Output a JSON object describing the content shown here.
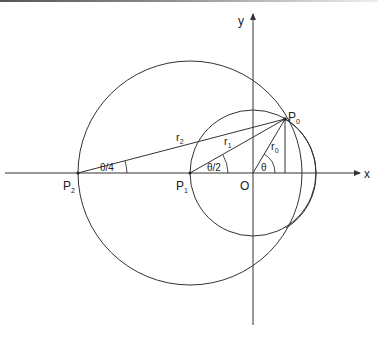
{
  "diagram": {
    "axes": {
      "x_label": "x",
      "y_label": "y",
      "origin_label": "O"
    },
    "points": {
      "P0": {
        "label": "P",
        "sub": "0"
      },
      "P1": {
        "label": "P",
        "sub": "1"
      },
      "P2": {
        "label": "P",
        "sub": "2"
      }
    },
    "radii": {
      "r0": {
        "label": "r",
        "sub": "0"
      },
      "r1": {
        "label": "r",
        "sub": "1"
      },
      "r2": {
        "label": "r",
        "sub": "2"
      }
    },
    "angles": {
      "theta": "θ",
      "theta_half": "θ/2",
      "theta_quarter": "θ/4"
    },
    "stroke_color": "#333333"
  }
}
